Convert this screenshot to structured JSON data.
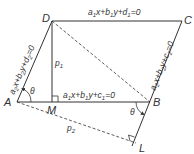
{
  "diagram": {
    "colors": {
      "stroke": "#333333",
      "background": "#ffffff"
    },
    "points": {
      "A": {
        "label": "A",
        "x": 17,
        "y": 102
      },
      "B": {
        "label": "B",
        "x": 150,
        "y": 102
      },
      "C": {
        "label": "C",
        "x": 182,
        "y": 21
      },
      "D": {
        "label": "D",
        "x": 52,
        "y": 21
      },
      "M": {
        "label": "M",
        "x": 52,
        "y": 102
      },
      "L": {
        "label": "L",
        "x": 136,
        "y": 145
      }
    },
    "lines": {
      "top": {
        "a": "a",
        "a_sub": "1",
        "x": "x+",
        "b": "b",
        "b_sub": "1",
        "y": "y+",
        "d": "d",
        "d_sub": "1",
        "eq": "=0"
      },
      "bottom": {
        "a": "a",
        "a_sub": "1",
        "x": "x+",
        "b": "b",
        "b_sub": "1",
        "y": "y+",
        "d": "c",
        "d_sub": "1",
        "eq": "=0"
      },
      "left": {
        "a": "a",
        "a_sub": "2",
        "x": "x+",
        "b": "b",
        "b_sub": "2",
        "y": "y+",
        "d": "d",
        "d_sub": "2",
        "eq": "=0"
      },
      "right": {
        "a": "a",
        "a_sub": "2",
        "x": "x+",
        "b": "b",
        "b_sub": "2",
        "y": "y+",
        "d": "c",
        "d_sub": "2",
        "eq": "=0"
      }
    },
    "distances": {
      "p1": {
        "p": "p",
        "sub": "1"
      },
      "p2": {
        "p": "p",
        "sub": "2"
      }
    },
    "angles": {
      "at_A": "θ",
      "at_B": "θ"
    }
  }
}
